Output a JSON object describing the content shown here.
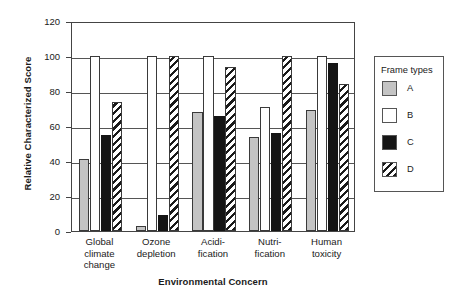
{
  "chart_data": {
    "type": "bar",
    "title": "",
    "xlabel": "Environmental Concern",
    "ylabel": "Relative Characterized Score",
    "categories": [
      "Global\nclimate\nchange",
      "Ozone\ndepletion",
      "Acidi-\nfication",
      "Nutri-\nfication",
      "Human\ntoxicity"
    ],
    "series": [
      {
        "name": "A",
        "values": [
          41,
          3,
          68,
          54,
          69
        ]
      },
      {
        "name": "B",
        "values": [
          100,
          100,
          100,
          71,
          100
        ]
      },
      {
        "name": "C",
        "values": [
          55,
          9,
          66,
          56,
          96
        ]
      },
      {
        "name": "D",
        "values": [
          74,
          100,
          94,
          100,
          84
        ]
      }
    ],
    "ylim": [
      0,
      120
    ],
    "yticks": [
      0,
      20,
      40,
      60,
      80,
      100,
      120
    ],
    "ytick_labels": [
      "0",
      "20",
      "40",
      "60",
      "80",
      "100",
      "120"
    ],
    "grid": "horizontal",
    "legend_position": "right-outside"
  },
  "legend": {
    "title": "Frame types",
    "entries": [
      {
        "label": "A",
        "pattern": "solid-gray",
        "color": "#c4c4c4"
      },
      {
        "label": "B",
        "pattern": "solid-white",
        "color": "#ffffff"
      },
      {
        "label": "C",
        "pattern": "solid-black",
        "color": "#151515"
      },
      {
        "label": "D",
        "pattern": "diagonal-hatch",
        "color": "#1a1a1a"
      }
    ]
  }
}
